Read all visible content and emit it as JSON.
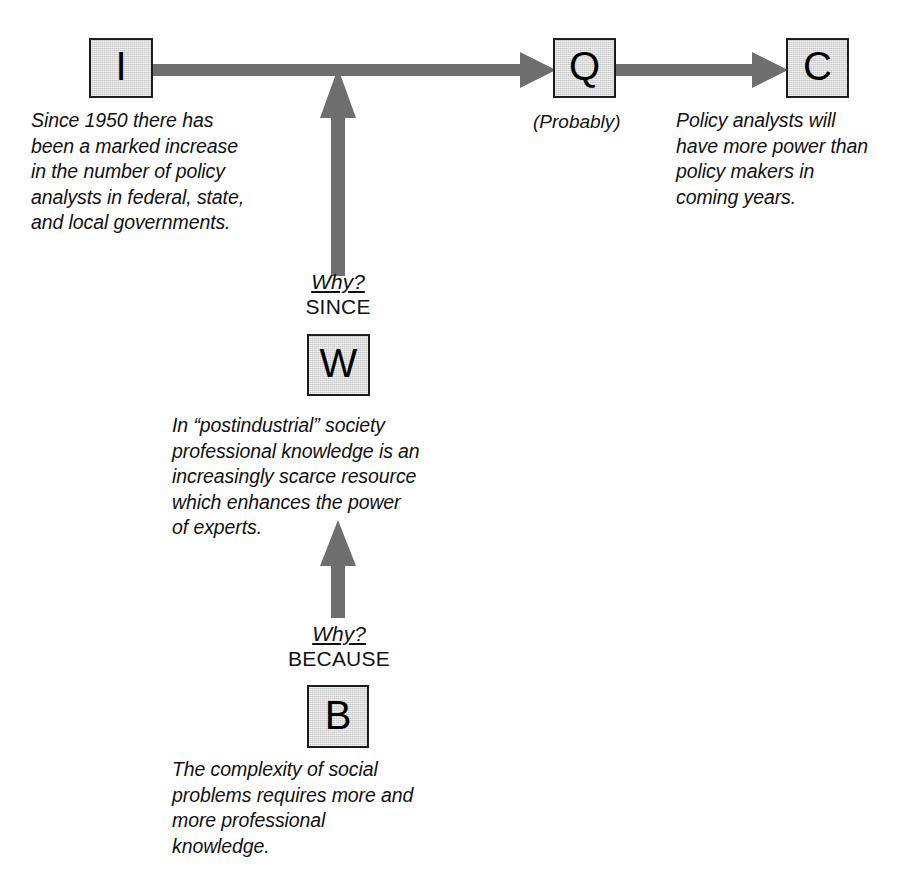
{
  "diagram": {
    "colors": {
      "box_fill": "#c9c9c9",
      "box_border": "#1c1c1c",
      "arrow": "#6e6e6e",
      "text": "#111111",
      "background": "#ffffff"
    }
  },
  "nodes": {
    "information": {
      "letter": "I",
      "text": "Since 1950 there has\nbeen a marked increase\nin the number of policy\nanalysts in federal, state,\nand local governments."
    },
    "qualifier": {
      "letter": "Q",
      "text": "(Probably)"
    },
    "claim": {
      "letter": "C",
      "text": "Policy analysts will\nhave more power than\npolicy makers in\ncoming years."
    },
    "warrant": {
      "letter": "W",
      "text": "In “postindustrial” society\nprofessional knowledge is an\nincreasingly scarce resource\nwhich enhances the power\nof experts."
    },
    "backing": {
      "letter": "B",
      "text": "The complexity of social\nproblems requires more and\nmore professional\nknowledge."
    }
  },
  "connectors": {
    "warrant_link": {
      "question": "Why?",
      "connective": "SINCE"
    },
    "backing_link": {
      "question": "Why?",
      "connective": "BECAUSE"
    }
  },
  "arrows": [
    {
      "name": "information-to-qualifier",
      "direction": "right"
    },
    {
      "name": "qualifier-to-claim",
      "direction": "right"
    },
    {
      "name": "warrant-to-main-line",
      "direction": "up"
    },
    {
      "name": "backing-to-warrant",
      "direction": "up"
    }
  ]
}
